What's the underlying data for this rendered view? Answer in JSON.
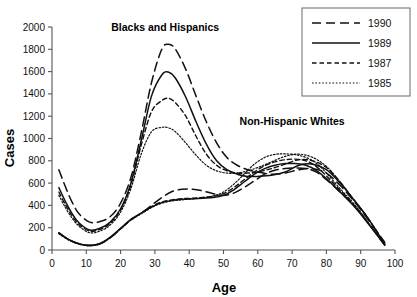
{
  "chart_data": {
    "type": "line",
    "title": "",
    "xlabel": "Age",
    "ylabel": "Cases",
    "xlim": [
      0,
      100
    ],
    "ylim": [
      0,
      2000
    ],
    "grid": false,
    "xticks": [
      "0",
      "10",
      "20",
      "30",
      "40",
      "50",
      "60",
      "70",
      "80",
      "90",
      "100"
    ],
    "yticks": [
      "0",
      "200",
      "400",
      "600",
      "800",
      "1000",
      "1200",
      "1400",
      "1600",
      "1800",
      "2000"
    ],
    "legend_position": "top-right",
    "annotations": [
      {
        "text": "Blacks and Hispanics",
        "x": 33,
        "y": 1960
      },
      {
        "text": "Non-Hispanic Whites",
        "x": 70,
        "y": 1120
      }
    ],
    "groups": [
      {
        "name": "Blacks and Hispanics",
        "series": [
          {
            "name": "1990",
            "style": "long-dash",
            "x": [
              2,
              4,
              6,
              8,
              11,
              14,
              17,
              20,
              23,
              26,
              29,
              32,
              34,
              36,
              39,
              42,
              45,
              48,
              51,
              54,
              57,
              60,
              64,
              68,
              72,
              76,
              80,
              84,
              88,
              92,
              97
            ],
            "values": [
              720,
              560,
              420,
              320,
              250,
              255,
              300,
              420,
              650,
              1050,
              1500,
              1800,
              1845,
              1800,
              1620,
              1380,
              1150,
              960,
              830,
              760,
              720,
              700,
              680,
              690,
              720,
              730,
              690,
              580,
              440,
              280,
              70
            ]
          },
          {
            "name": "1989",
            "style": "solid",
            "x": [
              2,
              4,
              6,
              8,
              11,
              14,
              17,
              20,
              23,
              26,
              29,
              32,
              34,
              36,
              39,
              42,
              45,
              48,
              51,
              54,
              57,
              60,
              64,
              68,
              72,
              76,
              80,
              84,
              88,
              92,
              97
            ],
            "values": [
              560,
              430,
              320,
              240,
              180,
              195,
              250,
              370,
              600,
              980,
              1380,
              1570,
              1595,
              1540,
              1370,
              1150,
              950,
              800,
              720,
              680,
              660,
              660,
              670,
              700,
              760,
              770,
              720,
              600,
              450,
              290,
              55
            ]
          },
          {
            "name": "1987",
            "style": "dash",
            "x": [
              2,
              4,
              6,
              8,
              11,
              14,
              17,
              20,
              23,
              26,
              29,
              32,
              34,
              36,
              39,
              42,
              45,
              48,
              51,
              54,
              57,
              60,
              64,
              68,
              72,
              76,
              80,
              84,
              88,
              92,
              97
            ],
            "values": [
              520,
              400,
              300,
              225,
              170,
              185,
              240,
              360,
              580,
              940,
              1240,
              1340,
              1360,
              1320,
              1200,
              1020,
              860,
              760,
              710,
              690,
              690,
              700,
              730,
              770,
              810,
              800,
              740,
              610,
              450,
              290,
              55
            ]
          },
          {
            "name": "1985",
            "style": "dot",
            "x": [
              2,
              4,
              6,
              8,
              11,
              14,
              17,
              20,
              23,
              26,
              29,
              32,
              34,
              36,
              39,
              42,
              45,
              48,
              51,
              54,
              57,
              60,
              64,
              68,
              72,
              76,
              80,
              84,
              88,
              92,
              97
            ],
            "values": [
              490,
              375,
              280,
              210,
              155,
              170,
              225,
              340,
              550,
              860,
              1060,
              1100,
              1095,
              1060,
              960,
              850,
              760,
              710,
              690,
              690,
              710,
              740,
              790,
              840,
              860,
              830,
              750,
              610,
              450,
              290,
              55
            ]
          }
        ]
      },
      {
        "name": "Non-Hispanic Whites",
        "series": [
          {
            "name": "1990",
            "style": "long-dash",
            "x": [
              2,
              5,
              8,
              11,
              14,
              17,
              20,
              23,
              26,
              29,
              32,
              35,
              38,
              41,
              44,
              47,
              50,
              53,
              56,
              59,
              62,
              65,
              68,
              71,
              74,
              77,
              80,
              84,
              88,
              92,
              97
            ],
            "values": [
              150,
              90,
              55,
              40,
              55,
              110,
              190,
              270,
              330,
              400,
              470,
              525,
              545,
              545,
              530,
              505,
              490,
              510,
              560,
              620,
              680,
              715,
              730,
              735,
              730,
              700,
              630,
              520,
              400,
              250,
              45
            ]
          },
          {
            "name": "1989",
            "style": "solid",
            "x": [
              2,
              5,
              8,
              11,
              14,
              17,
              20,
              23,
              26,
              29,
              32,
              35,
              38,
              41,
              44,
              47,
              50,
              53,
              56,
              59,
              62,
              65,
              68,
              71,
              74,
              77,
              80,
              84,
              88,
              92,
              97
            ],
            "values": [
              155,
              92,
              55,
              42,
              58,
              115,
              195,
              275,
              330,
              385,
              425,
              445,
              455,
              460,
              465,
              470,
              490,
              540,
              610,
              680,
              730,
              760,
              775,
              775,
              760,
              715,
              640,
              520,
              395,
              245,
              45
            ]
          },
          {
            "name": "1987",
            "style": "dash",
            "x": [
              2,
              5,
              8,
              11,
              14,
              17,
              20,
              23,
              26,
              29,
              32,
              35,
              38,
              41,
              44,
              47,
              50,
              53,
              56,
              59,
              62,
              65,
              68,
              71,
              74,
              77,
              80,
              84,
              88,
              92,
              97
            ],
            "values": [
              150,
              90,
              54,
              40,
              56,
              112,
              192,
              272,
              330,
              390,
              430,
              450,
              460,
              465,
              472,
              482,
              505,
              560,
              630,
              700,
              755,
              790,
              810,
              815,
              800,
              750,
              665,
              535,
              405,
              250,
              45
            ]
          },
          {
            "name": "1985",
            "style": "dot",
            "x": [
              2,
              5,
              8,
              11,
              14,
              17,
              20,
              23,
              26,
              29,
              32,
              35,
              38,
              41,
              44,
              47,
              50,
              53,
              56,
              59,
              62,
              65,
              68,
              71,
              74,
              77,
              80,
              84,
              88,
              92,
              97
            ],
            "values": [
              145,
              88,
              52,
              38,
              55,
              110,
              188,
              268,
              325,
              380,
              420,
              440,
              450,
              458,
              468,
              485,
              520,
              590,
              680,
              770,
              830,
              858,
              862,
              855,
              830,
              780,
              690,
              550,
              415,
              255,
              45
            ]
          }
        ]
      }
    ],
    "legend": [
      {
        "label": "1990",
        "style": "long-dash"
      },
      {
        "label": "1989",
        "style": "solid"
      },
      {
        "label": "1987",
        "style": "dash"
      },
      {
        "label": "1985",
        "style": "dot"
      }
    ]
  }
}
